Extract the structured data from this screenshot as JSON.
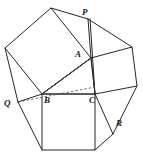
{
  "figure": {
    "type": "geometry-diagram",
    "width": 143,
    "height": 159,
    "background_color": "#ffffff",
    "stroke_color": "#262626",
    "dashed_stroke_color": "#4a4a4a",
    "fill_color": "none",
    "stroke_width": 1.0
  },
  "labels": [
    {
      "id": "P",
      "text": "P",
      "x": 82,
      "y": 8
    },
    {
      "id": "A",
      "text": "A",
      "x": 75,
      "y": 50
    },
    {
      "id": "Q",
      "text": "Q",
      "x": 4,
      "y": 99
    },
    {
      "id": "B",
      "text": "B",
      "x": 44,
      "y": 96
    },
    {
      "id": "C",
      "text": "C",
      "x": 89,
      "y": 96
    },
    {
      "id": "R",
      "text": "R",
      "x": 116,
      "y": 119
    }
  ],
  "points": {
    "A": {
      "x": 91,
      "y": 58
    },
    "B": {
      "x": 42,
      "y": 94
    },
    "C": {
      "x": 95,
      "y": 94
    },
    "P": {
      "x": 88,
      "y": 19
    },
    "Q": {
      "x": 18,
      "y": 102
    },
    "R": {
      "x": 113,
      "y": 134
    },
    "sqAB_outer1": {
      "x": 51,
      "y": 8
    },
    "sqAB_outer2": {
      "x": 5,
      "y": 48
    },
    "sqAC_outer1": {
      "x": 132,
      "y": 47
    },
    "sqAC_outer2": {
      "x": 137,
      "y": 86
    },
    "sqBC_outer1": {
      "x": 42,
      "y": 150
    },
    "sqBC_outer2": {
      "x": 95,
      "y": 150
    }
  },
  "polygons": [
    {
      "name": "square-on-AB",
      "vertices": "91,58 51,8 5,48 42,94"
    },
    {
      "name": "square-on-AC",
      "vertices": "91,58 132,47 137,86 95,94"
    },
    {
      "name": "square-on-BC",
      "vertices": "42,94 95,94 95,150 42,150"
    },
    {
      "name": "triangle-ABC",
      "vertices": "91,58 42,94 95,94"
    }
  ],
  "solid_segments": [
    {
      "name": "P-to-sqAB-apex",
      "x1": 88,
      "y1": 19,
      "x2": 51,
      "y2": 8
    },
    {
      "name": "P-to-A",
      "x1": 88,
      "y1": 19,
      "x2": 91,
      "y2": 58
    },
    {
      "name": "P-to-sqAC-outer1",
      "x1": 88,
      "y1": 19,
      "x2": 132,
      "y2": 47
    },
    {
      "name": "P-vertical-to-C",
      "x1": 90,
      "y1": 19,
      "x2": 95,
      "y2": 94
    },
    {
      "name": "Q-to-sqAB-outer2",
      "x1": 18,
      "y1": 102,
      "x2": 5,
      "y2": 48
    },
    {
      "name": "Q-to-B",
      "x1": 18,
      "y1": 102,
      "x2": 42,
      "y2": 94
    },
    {
      "name": "Q-to-sqBC-bottomleft",
      "x1": 18,
      "y1": 102,
      "x2": 42,
      "y2": 150
    },
    {
      "name": "R-to-sqAC-outer2",
      "x1": 113,
      "y1": 134,
      "x2": 137,
      "y2": 86
    },
    {
      "name": "R-to-C",
      "x1": 113,
      "y1": 134,
      "x2": 95,
      "y2": 94
    },
    {
      "name": "R-to-sqBC-bottomright",
      "x1": 113,
      "y1": 134,
      "x2": 95,
      "y2": 150
    },
    {
      "name": "A-to-B-cevian",
      "x1": 91,
      "y1": 58,
      "x2": 42,
      "y2": 94
    }
  ],
  "dashed_segments": [
    {
      "name": "Q-to-C-dashed",
      "x1": 18,
      "y1": 102,
      "x2": 95,
      "y2": 87
    },
    {
      "name": "B-to-A-inner-dashed",
      "x1": 42,
      "y1": 94,
      "x2": 91,
      "y2": 58
    }
  ]
}
